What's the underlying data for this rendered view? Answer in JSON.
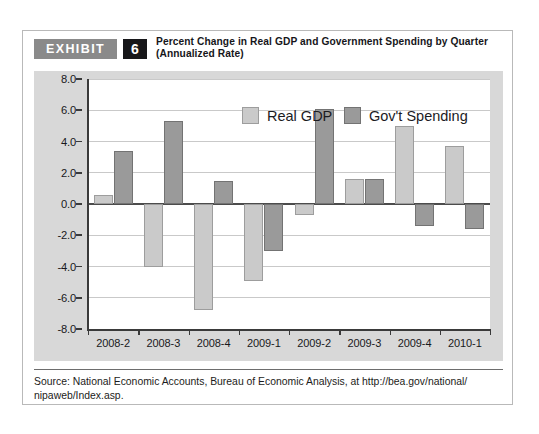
{
  "exhibit": {
    "badge_label": "EXHIBIT",
    "number": "6",
    "title_line1": "Percent Change in Real GDP and Government Spending by Quarter",
    "title_line2": "(Annualized Rate)"
  },
  "source": {
    "label": "Source:",
    "text": "National Economic Accounts, Bureau of Economic Analysis, at http://bea.gov/national/ nipaweb/Index.asp."
  },
  "colors": {
    "gdp_fill": "#cacaca",
    "gdp_border": "#9d9d9d",
    "gov_fill": "#9a9a9a",
    "gov_border": "#737373",
    "panel_bg": "#d8d8d8",
    "plot_bg": "#ffffff",
    "axis": "#3a3a3a",
    "grid": "#c9c9c9",
    "badge_bg": "#8a8a8a",
    "number_bg": "#17171a"
  },
  "chart_data": {
    "type": "bar",
    "title": "Percent Change in Real GDP and Government Spending by Quarter (Annualized Rate)",
    "xlabel": "",
    "ylabel": "",
    "ylim": [
      -8.0,
      8.0
    ],
    "yticks": [
      "8.0",
      "6.0",
      "4.0",
      "2.0",
      "0.0",
      "-2.0",
      "-4.0",
      "-6.0",
      "-8.0"
    ],
    "ytick_values": [
      8.0,
      6.0,
      4.0,
      2.0,
      0.0,
      -2.0,
      -4.0,
      -6.0,
      -8.0
    ],
    "grid": true,
    "legend_position": "top-right-inside",
    "categories": [
      "2008-2",
      "2008-3",
      "2008-4",
      "2009-1",
      "2009-2",
      "2009-3",
      "2009-4",
      "2010-1"
    ],
    "series": [
      {
        "name": "Real GDP",
        "values": [
          0.6,
          -4.0,
          -6.8,
          -4.9,
          -0.7,
          1.6,
          5.0,
          3.7
        ]
      },
      {
        "name": "Gov't Spending",
        "values": [
          3.4,
          5.3,
          1.5,
          -3.0,
          6.1,
          1.6,
          -1.4,
          -1.6
        ]
      }
    ]
  }
}
